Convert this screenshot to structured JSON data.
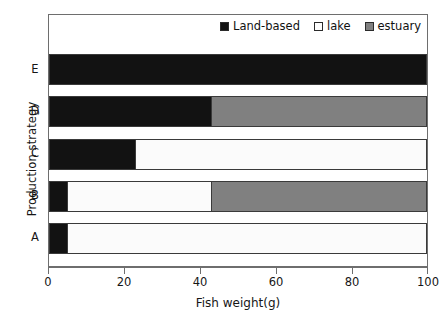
{
  "chart_data": {
    "type": "bar",
    "orientation": "horizontal",
    "stacked": true,
    "title": "",
    "xlabel": "Fish weight(g)",
    "ylabel": "Production strategy",
    "xlim": [
      0,
      100
    ],
    "xticks": [
      0,
      20,
      40,
      60,
      80,
      100
    ],
    "xticklabels": [
      "0",
      "20",
      "40",
      "60",
      "80",
      "100"
    ],
    "categories": [
      "A",
      "B",
      "C",
      "D",
      "E"
    ],
    "category_order_top_to_bottom": [
      "E",
      "D",
      "C",
      "B",
      "A"
    ],
    "grid": false,
    "legend_position": "top-right",
    "series": [
      {
        "name": "Land-based",
        "color": "#121212",
        "values": [
          5,
          5,
          23,
          43,
          100
        ]
      },
      {
        "name": "lake",
        "color": "#fbfbfb",
        "values": [
          95,
          38,
          77,
          0,
          0
        ]
      },
      {
        "name": "estuary",
        "color": "#808080",
        "values": [
          0,
          57,
          0,
          57,
          0
        ]
      }
    ],
    "rows": [
      {
        "category": "E",
        "segments": [
          {
            "series": "Land-based",
            "start": 0,
            "end": 100,
            "value": 100
          }
        ]
      },
      {
        "category": "D",
        "segments": [
          {
            "series": "Land-based",
            "start": 0,
            "end": 43,
            "value": 43
          },
          {
            "series": "estuary",
            "start": 43,
            "end": 100,
            "value": 57
          }
        ]
      },
      {
        "category": "C",
        "segments": [
          {
            "series": "Land-based",
            "start": 0,
            "end": 23,
            "value": 23
          },
          {
            "series": "lake",
            "start": 23,
            "end": 100,
            "value": 77
          }
        ]
      },
      {
        "category": "B",
        "segments": [
          {
            "series": "Land-based",
            "start": 0,
            "end": 5,
            "value": 5
          },
          {
            "series": "lake",
            "start": 5,
            "end": 43,
            "value": 38
          },
          {
            "series": "estuary",
            "start": 43,
            "end": 100,
            "value": 57
          }
        ]
      },
      {
        "category": "A",
        "segments": [
          {
            "series": "Land-based",
            "start": 0,
            "end": 5,
            "value": 5
          },
          {
            "series": "lake",
            "start": 5,
            "end": 100,
            "value": 95
          }
        ]
      }
    ]
  },
  "legend": {
    "entries": [
      {
        "label": "Land-based",
        "swatch": "black-square-swatch",
        "color": "#121212"
      },
      {
        "label": "lake",
        "swatch": "white-square-swatch",
        "color": "#fdfdfd"
      },
      {
        "label": "estuary",
        "swatch": "gray-square-swatch",
        "color": "#808080"
      }
    ]
  },
  "axes": {
    "x_title": "Fish weight(g)",
    "y_title": "Production strategy"
  },
  "colors": {
    "land_based": "#121212",
    "lake": "#fbfbfb",
    "estuary": "#808080",
    "frame": "#6e6e6e",
    "text": "#161616"
  }
}
